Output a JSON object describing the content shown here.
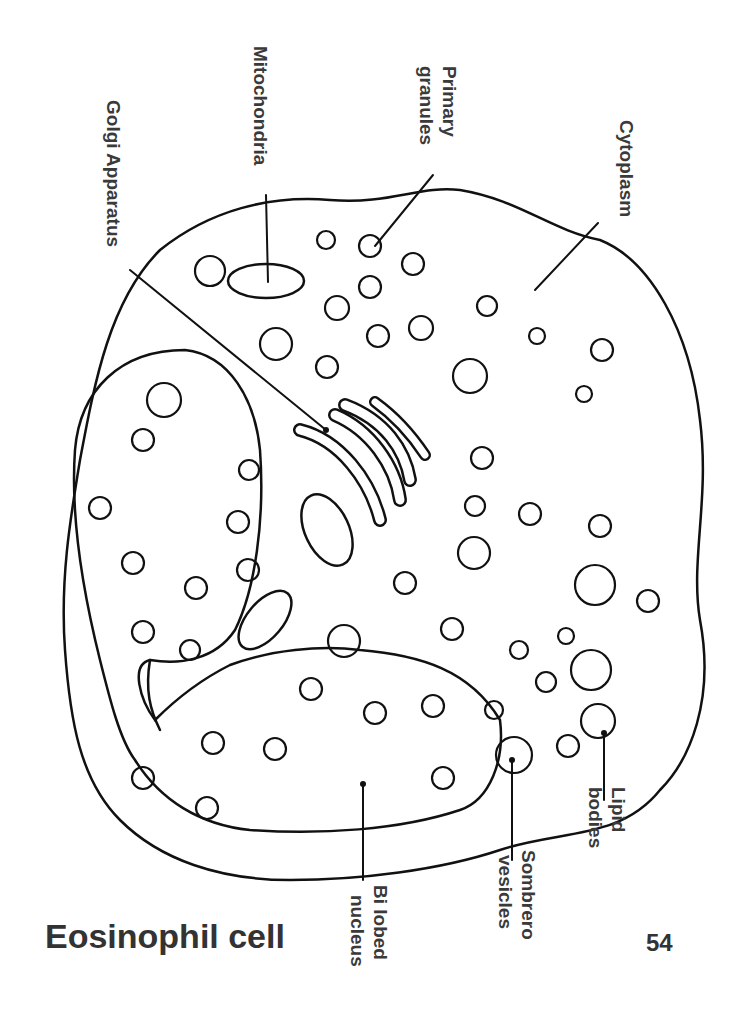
{
  "title": "Eosinophil cell",
  "page_number": "54",
  "labels": {
    "golgi": "Golgi Apparatus",
    "mito": "Mitochondria",
    "primary1": "Primary",
    "primary2": "granules",
    "cytoplasm": "Cytoplasm",
    "nucleus1": "Bi lobed",
    "nucleus2": "nucleus",
    "sombrero1": "Sombrero",
    "sombrero2": "vesicles",
    "lipid1": "Lipid",
    "lipid2": "bodies"
  },
  "colors": {
    "ink": "#111111",
    "text": "#3a3a3a"
  }
}
